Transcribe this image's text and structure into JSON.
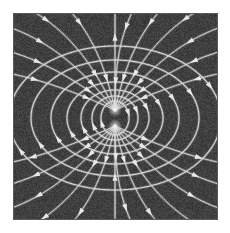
{
  "figure": {
    "title": "Magnetic dipole field lines",
    "type": "field-line-diagram",
    "width": 230,
    "height": 233,
    "page_background": "#ffffff",
    "plot_background": "#3f3f3f",
    "line_color": "#d8d8d8",
    "border_color": "#5a5a5a",
    "noise_enabled": true
  },
  "plot_area": {
    "x": 13,
    "y": 13,
    "width": 205,
    "height": 207
  },
  "chart_data": {
    "type": "line",
    "title": "Magnetic dipole field lines",
    "subtitle": "",
    "xlabel": "",
    "ylabel": "",
    "xlim": [
      13,
      218
    ],
    "ylim": [
      13,
      220
    ],
    "grid": false,
    "legend": null,
    "annotations": [],
    "dipole": {
      "center_x": 115,
      "center_y": 118,
      "north_pole_x": 115,
      "north_pole_y": 110,
      "south_pole_x": 115,
      "south_pole_y": 126,
      "separation": 16,
      "axis_orientation": "vertical",
      "flow_direction": "upward-along-axis"
    },
    "loops": [
      {
        "id": "loop-1",
        "side": "left",
        "rx": 14,
        "ry": 9,
        "arrow_count": 1
      },
      {
        "id": "loop-2",
        "side": "right",
        "rx": 14,
        "ry": 9,
        "arrow_count": 1
      },
      {
        "id": "loop-3",
        "side": "left",
        "rx": 23,
        "ry": 14,
        "arrow_count": 1
      },
      {
        "id": "loop-4",
        "side": "right",
        "rx": 23,
        "ry": 14,
        "arrow_count": 1
      },
      {
        "id": "loop-5",
        "side": "left",
        "rx": 34,
        "ry": 20,
        "arrow_count": 1
      },
      {
        "id": "loop-6",
        "side": "right",
        "rx": 34,
        "ry": 20,
        "arrow_count": 1
      },
      {
        "id": "loop-7",
        "side": "left",
        "rx": 48,
        "ry": 28,
        "arrow_count": 1
      },
      {
        "id": "loop-8",
        "side": "right",
        "rx": 48,
        "ry": 28,
        "arrow_count": 1
      },
      {
        "id": "loop-9",
        "side": "left",
        "rx": 64,
        "ry": 38,
        "arrow_count": 1
      },
      {
        "id": "loop-10",
        "side": "right",
        "rx": 64,
        "ry": 38,
        "arrow_count": 1
      },
      {
        "id": "loop-11",
        "side": "left",
        "rx": 84,
        "ry": 50,
        "arrow_count": 1
      },
      {
        "id": "loop-12",
        "side": "right",
        "rx": 84,
        "ry": 50,
        "arrow_count": 1
      },
      {
        "id": "loop-13",
        "side": "left",
        "rx": 106,
        "ry": 64,
        "arrow_count": 1
      },
      {
        "id": "loop-14",
        "side": "right",
        "rx": 106,
        "ry": 64,
        "arrow_count": 1
      }
    ],
    "open_lines": {
      "count_per_pole": 11,
      "description": "Lines emerging from the north pole fan outward to the top and sides; lines entering the south pole fan inward from the bottom and sides.",
      "axis_line": {
        "present": true,
        "arrow_count": 3
      }
    },
    "arrowheads": {
      "style": "filled-triangle",
      "length": 5,
      "width": 4,
      "color": "#e8e8e8",
      "total": 40
    }
  },
  "accessibility": {
    "alt_text": "Grayscale diagram of a magnetic dipole field: curved white field lines on a dark gray square, converging at two points near the center and looping outward symmetrically to left and right, with small arrowheads indicating field direction."
  }
}
